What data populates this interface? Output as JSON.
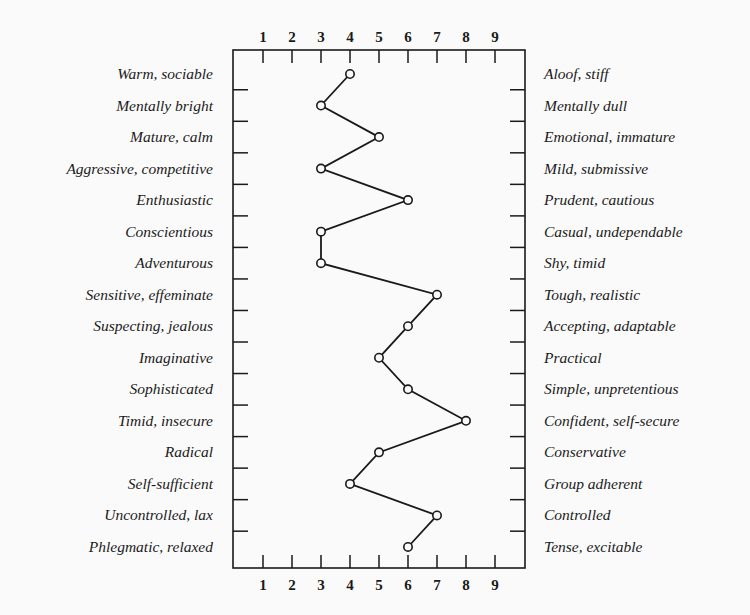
{
  "chart_data": {
    "type": "line",
    "title": "",
    "orientation": "vertical-profile",
    "xlabel": "",
    "ylabel": "",
    "x_ticks": [
      1,
      2,
      3,
      4,
      5,
      6,
      7,
      8,
      9
    ],
    "xlim": [
      1,
      9
    ],
    "grid": false,
    "legend": null,
    "left_labels": [
      "Warm, sociable",
      "Mentally bright",
      "Mature, calm",
      "Aggressive, competitive",
      "Enthusiastic",
      "Conscientious",
      "Adventurous",
      "Sensitive, effeminate",
      "Suspecting, jealous",
      "Imaginative",
      "Sophisticated",
      "Timid, insecure",
      "Radical",
      "Self-sufficient",
      "Uncontrolled, lax",
      "Phlegmatic, relaxed"
    ],
    "right_labels": [
      "Aloof, stiff",
      "Mentally dull",
      "Emotional, immature",
      "Mild, submissive",
      "Prudent, cautious",
      "Casual, undependable",
      "Shy, timid",
      "Tough, realistic",
      "Accepting, adaptable",
      "Practical",
      "Simple, unpretentious",
      "Confident, self-secure",
      "Conservative",
      "Group adherent",
      "Controlled",
      "Tense, excitable"
    ],
    "series": [
      {
        "name": "Profile",
        "values": [
          4,
          3,
          5,
          3,
          6,
          3,
          3,
          7,
          6,
          5,
          6,
          8,
          5,
          4,
          7,
          6
        ]
      }
    ]
  },
  "colors": {
    "background": "#fafafa",
    "ink": "#1a1a1a"
  }
}
